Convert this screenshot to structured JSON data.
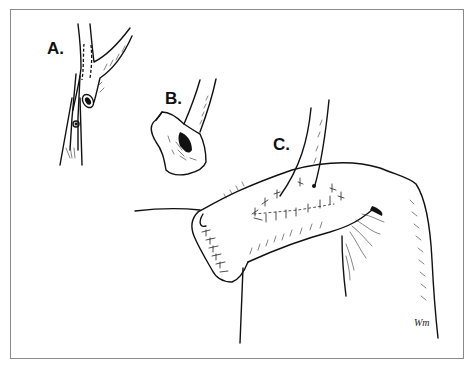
{
  "figure": {
    "panels": [
      {
        "label": "A.",
        "description": "Vessel branch with dashed incision line, clamped"
      },
      {
        "label": "B.",
        "description": "Opened vessel cuff / patch"
      },
      {
        "label": "C.",
        "description": "Cuff sutured onto bowel loop with interrupted sutures"
      }
    ],
    "signature": "Wm"
  }
}
